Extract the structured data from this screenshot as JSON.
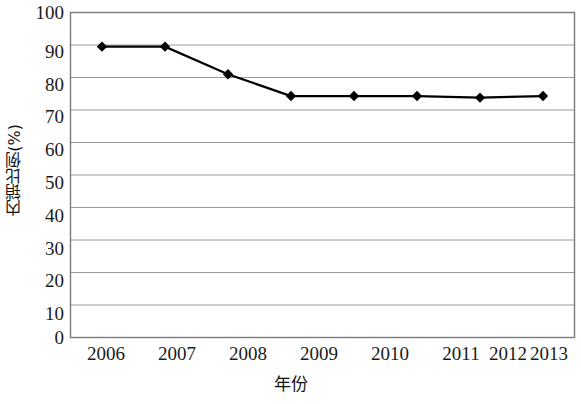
{
  "chart_data": {
    "type": "line",
    "title": "",
    "xlabel": "年份",
    "ylabel": "内销比例(%)",
    "categories": [
      "2006",
      "2007",
      "2008",
      "2009",
      "2010",
      "2011",
      "2012",
      "2013"
    ],
    "values": [
      89.5,
      89.5,
      81.0,
      74.3,
      74.3,
      74.3,
      73.8,
      74.3
    ],
    "series": [
      {
        "name": "内销比例",
        "values": [
          89.5,
          89.5,
          81.0,
          74.3,
          74.3,
          74.3,
          73.8,
          74.3
        ]
      }
    ],
    "ylim": [
      0,
      100
    ],
    "ytick_step": 10,
    "yticks": [
      "0",
      "10",
      "20",
      "30",
      "40",
      "50",
      "60",
      "70",
      "80",
      "90",
      "100"
    ],
    "grid": "horizontal",
    "legend": "none",
    "marker": "diamond",
    "line_color": "#000000",
    "marker_color": "#000000",
    "grid_color": "#9a9a9a",
    "frame_color": "#7a7a7a",
    "plot_background": "#ffffff"
  }
}
